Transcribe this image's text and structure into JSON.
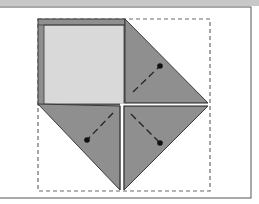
{
  "diagram": {
    "type": "origami-fold-step",
    "colors": {
      "background": "#ffffff",
      "frame": "#555555",
      "top_band": "#c8c8c8",
      "paper_light": "#d9d9d9",
      "paper_dark": "#8f8f8f",
      "paper_edge": "#9a9a9a",
      "crease_white": "#ffffff",
      "outline": "#3a3a3a",
      "dashed_guide": "#6a6a6a",
      "fold_line": "#222222",
      "dot": "#111111"
    },
    "frame": {
      "x": -2,
      "y": 7,
      "width": 253,
      "height": 191
    },
    "guide_square": {
      "x": 38,
      "y": 19,
      "width": 172,
      "height": 172,
      "style": "dashed"
    },
    "center": {
      "x": 122,
      "y": 105
    },
    "flaps": [
      {
        "name": "right-flap",
        "dot": {
          "x": 160,
          "y": 66
        },
        "line_from": {
          "x": 133,
          "y": 92
        }
      },
      {
        "name": "bottom-left-flap",
        "dot": {
          "x": 87,
          "y": 140
        },
        "line_from": {
          "x": 113,
          "y": 113
        }
      },
      {
        "name": "bottom-right-flap",
        "dot": {
          "x": 160,
          "y": 143
        },
        "line_from": {
          "x": 131,
          "y": 114
        }
      }
    ]
  }
}
